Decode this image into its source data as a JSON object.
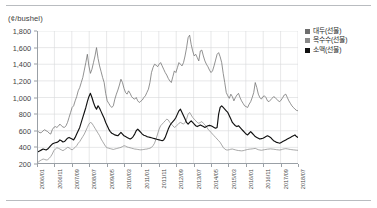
{
  "chart_data": {
    "type": "line",
    "title": "",
    "subtitle": "",
    "unit_label": "(¢/bushel)",
    "xlabel": "",
    "ylabel": "",
    "ylim": [
      200,
      1800
    ],
    "y_ticks": [
      "1,800",
      "1,600",
      "1,400",
      "1,200",
      "1,000",
      "800",
      "600",
      "400",
      "200"
    ],
    "y_tick_values": [
      1800,
      1600,
      1400,
      1200,
      1000,
      800,
      600,
      400,
      200
    ],
    "grid": true,
    "legend_position": "right",
    "x_tick_labels": [
      "2006/01",
      "2006/11",
      "2007/09",
      "2008/07",
      "2009/05",
      "2010/03",
      "2011/01",
      "2011/11",
      "2012/09",
      "2013/07",
      "2014/05",
      "2015/03",
      "2016/01",
      "2016/11",
      "2017/09",
      "2018/07"
    ],
    "x_start": "2006/01",
    "x_end": "2018/07",
    "series": [
      {
        "name": "대두(선물)",
        "color": "#6e6e6e",
        "values": [
          598,
          588,
          575,
          580,
          600,
          612,
          600,
          590,
          570,
          560,
          612,
          640,
          650,
          640,
          655,
          680,
          660,
          645,
          640,
          660,
          700,
          760,
          820,
          880,
          900,
          960,
          1010,
          1080,
          1120,
          1180,
          1240,
          1330,
          1420,
          1520,
          1380,
          1290,
          1340,
          1420,
          1500,
          1600,
          1470,
          1380,
          1310,
          1240,
          1180,
          1050,
          960,
          930,
          900,
          880,
          900,
          980,
          1040,
          1090,
          1150,
          1220,
          1180,
          1110,
          1060,
          1040,
          1080,
          1050,
          1010,
          990,
          980,
          1000,
          960,
          940,
          955,
          970,
          1000,
          1020,
          1060,
          1100,
          1180,
          1300,
          1360,
          1400,
          1390,
          1370,
          1400,
          1420,
          1380,
          1340,
          1300,
          1270,
          1230,
          1200,
          1180,
          1250,
          1320,
          1300,
          1360,
          1420,
          1400,
          1380,
          1420,
          1500,
          1600,
          1720,
          1750,
          1640,
          1560,
          1500,
          1520,
          1480,
          1440,
          1560,
          1570,
          1500,
          1440,
          1400,
          1370,
          1330,
          1300,
          1320,
          1380,
          1450,
          1520,
          1540,
          1490,
          1420,
          1290,
          1180,
          1060,
          1020,
          990,
          1040,
          1010,
          960,
          1000,
          1030,
          1050,
          1000,
          960,
          930,
          900,
          890,
          880,
          920,
          950,
          1000,
          1060,
          1180,
          1120,
          1040,
          1000,
          980,
          1010,
          1020,
          1000,
          960,
          950,
          970,
          990,
          1010,
          1000,
          980,
          960,
          950,
          970,
          1000,
          1030,
          1040,
          1000,
          960,
          930,
          900,
          880,
          860,
          845,
          840
        ]
      },
      {
        "name": "옥수수(선물)",
        "color": "#8a8a8a",
        "values": [
          210,
          225,
          240,
          250,
          260,
          255,
          248,
          252,
          268,
          290,
          320,
          360,
          380,
          395,
          390,
          380,
          370,
          360,
          372,
          385,
          400,
          395,
          380,
          370,
          385,
          400,
          420,
          450,
          470,
          500,
          530,
          560,
          600,
          640,
          680,
          700,
          690,
          660,
          630,
          600,
          570,
          540,
          500,
          470,
          440,
          410,
          395,
          390,
          385,
          380,
          375,
          380,
          385,
          390,
          395,
          400,
          410,
          420,
          415,
          405,
          400,
          395,
          390,
          385,
          380,
          378,
          375,
          372,
          370,
          372,
          375,
          378,
          380,
          385,
          390,
          400,
          420,
          450,
          500,
          560,
          620,
          660,
          680,
          700,
          720,
          740,
          730,
          700,
          680,
          660,
          640,
          650,
          670,
          690,
          700,
          690,
          680,
          700,
          740,
          800,
          820,
          790,
          760,
          740,
          720,
          700,
          690,
          700,
          710,
          690,
          670,
          650,
          620,
          600,
          580,
          560,
          540,
          520,
          500,
          480,
          460,
          430,
          400,
          380,
          370,
          368,
          372,
          378,
          380,
          375,
          370,
          365,
          362,
          360,
          358,
          360,
          365,
          370,
          375,
          378,
          380,
          382,
          385,
          388,
          380,
          372,
          368,
          365,
          368,
          372,
          375,
          378,
          380,
          382,
          380,
          378,
          375,
          372,
          370,
          368,
          372,
          378,
          382,
          385,
          382,
          378,
          375,
          372,
          370,
          368,
          366,
          365
        ]
      },
      {
        "name": "소맥(선물)",
        "color": "#111111",
        "values": [
          340,
          350,
          360,
          370,
          380,
          375,
          368,
          380,
          400,
          420,
          440,
          450,
          455,
          460,
          470,
          490,
          480,
          465,
          470,
          490,
          510,
          520,
          510,
          500,
          490,
          520,
          560,
          600,
          640,
          700,
          760,
          820,
          880,
          950,
          1010,
          1050,
          1000,
          940,
          890,
          860,
          900,
          870,
          830,
          790,
          750,
          700,
          660,
          620,
          590,
          570,
          560,
          550,
          545,
          540,
          560,
          580,
          560,
          540,
          530,
          520,
          510,
          500,
          510,
          530,
          560,
          600,
          620,
          600,
          580,
          560,
          545,
          540,
          530,
          525,
          520,
          515,
          510,
          505,
          500,
          495,
          490,
          485,
          480,
          490,
          520,
          570,
          620,
          660,
          690,
          710,
          730,
          760,
          800,
          840,
          860,
          820,
          780,
          740,
          700,
          680,
          700,
          720,
          700,
          680,
          660,
          650,
          660,
          670,
          660,
          650,
          640,
          650,
          660,
          665,
          660,
          650,
          640,
          630,
          640,
          800,
          880,
          900,
          880,
          860,
          840,
          820,
          780,
          740,
          700,
          680,
          660,
          650,
          660,
          640,
          620,
          600,
          580,
          560,
          550,
          570,
          590,
          570,
          550,
          530,
          520,
          510,
          500,
          505,
          510,
          520,
          530,
          540,
          530,
          520,
          500,
          480,
          470,
          460,
          455,
          450,
          460,
          470,
          480,
          490,
          500,
          510,
          520,
          530,
          540,
          550,
          530,
          520
        ]
      }
    ]
  }
}
